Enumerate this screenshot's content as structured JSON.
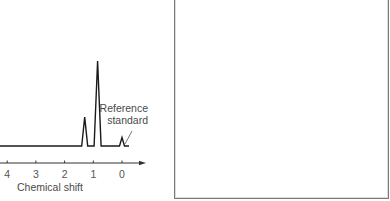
{
  "chart_data": {
    "type": "line",
    "title": "",
    "xlabel": "Chemical shift",
    "ylabel": "",
    "x_reversed": true,
    "xlim": [
      4.25,
      -0.8
    ],
    "ticks": [
      4,
      3,
      2,
      1,
      0
    ],
    "tick_labels": [
      "4",
      "3",
      "2",
      "1",
      "0"
    ],
    "grid": false,
    "legend": null,
    "peaks": [
      {
        "shift": 1.3,
        "relative_height": 0.34,
        "label": ""
      },
      {
        "shift": 0.85,
        "relative_height": 1.0,
        "label": ""
      },
      {
        "shift": 0.0,
        "relative_height": 0.1,
        "label": "Reference standard"
      }
    ],
    "annotations": [
      {
        "text_lines": [
          "Reference",
          "standard"
        ],
        "points_to_shift": 0.0
      }
    ]
  },
  "labels": {
    "xlabel": "Chemical shift",
    "ref_line1": "Reference",
    "ref_line2": "standard"
  },
  "right_panel": {
    "content": ""
  },
  "colors": {
    "trace": "#1a1a1a",
    "axis": "#333333",
    "text": "#4a4a4a",
    "panel_border": "#7a7a7a"
  }
}
